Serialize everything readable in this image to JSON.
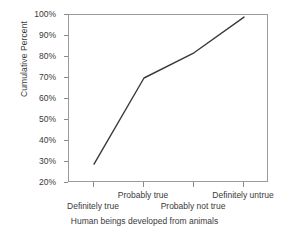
{
  "chart_data": {
    "type": "line",
    "title": "",
    "subtitle": "",
    "xlabel": "Human beings developed from animals",
    "ylabel": "Cumulative Percent",
    "categories": [
      "Definitely true",
      "Probably true",
      "Probably not true",
      "Definitely untrue"
    ],
    "values": [
      29,
      70,
      82,
      99
    ],
    "series": [
      {
        "name": "Cumulative Percent",
        "values": [
          29,
          70,
          82,
          99
        ]
      }
    ],
    "ylim": [
      20,
      100
    ],
    "ytick_labels": [
      "100%",
      "90%",
      "80%",
      "70%",
      "60%",
      "50%",
      "40%",
      "30%",
      "20%"
    ],
    "ytick_values": [
      100,
      90,
      80,
      70,
      60,
      50,
      40,
      30,
      20
    ],
    "grid": false,
    "legend": false,
    "legend_position": "none",
    "line_color": "#3a3a3a",
    "frame_color": "#9a9a9a",
    "background_color": "#ffffff",
    "markers": false,
    "xlabel_stagger": [
      "lower",
      "upper",
      "lower",
      "upper"
    ]
  }
}
